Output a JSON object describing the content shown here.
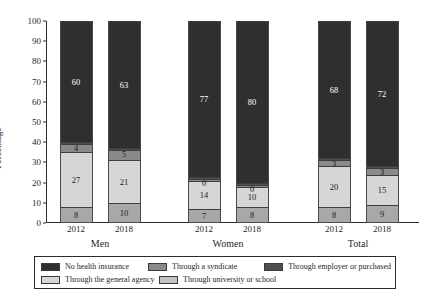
{
  "chart_data": {
    "type": "bar",
    "subtype": "stacked-bar-100",
    "title": "",
    "xlabel": "",
    "ylabel": "Percentage",
    "ylim": [
      0,
      100
    ],
    "ytick_labels": [
      "0",
      "10",
      "20",
      "30",
      "40",
      "50",
      "60",
      "70",
      "80",
      "90",
      "100"
    ],
    "ytick_values": [
      0,
      10,
      20,
      30,
      40,
      50,
      60,
      70,
      80,
      90,
      100
    ],
    "grid": false,
    "legend_position": "bottom",
    "groups": [
      "Men",
      "Women",
      "Total"
    ],
    "categories": [
      "2012",
      "2018",
      "2012",
      "2018",
      "2012",
      "2018"
    ],
    "series": [
      {
        "name": "Through university or school",
        "color": "#a8a8a8",
        "values": [
          8,
          10,
          7,
          8,
          8,
          9
        ],
        "labels": [
          "8",
          "10",
          "7",
          "8",
          "8",
          "9"
        ]
      },
      {
        "name": "Through the general agency",
        "color": "#d6d6d6",
        "values": [
          27,
          21,
          14,
          10,
          20,
          15
        ],
        "labels": [
          "27",
          "21",
          "14",
          "10",
          "20",
          "15"
        ]
      },
      {
        "name": "Through a syndicate",
        "color": "#8a8a8a",
        "values": [
          4,
          5,
          1,
          1,
          3,
          3
        ],
        "labels": [
          "4",
          "5",
          "0",
          "0",
          "3",
          "3"
        ]
      },
      {
        "name": "Through employer or purchased",
        "color": "#4f4f4f",
        "values": [
          1,
          1,
          1,
          1,
          1,
          1
        ],
        "labels": [
          "1",
          "1",
          "0",
          "0",
          "1",
          "1"
        ]
      },
      {
        "name": "No health insurance",
        "color": "#2f2f2f",
        "values": [
          60,
          63,
          77,
          80,
          68,
          72
        ],
        "labels": [
          "60",
          "63",
          "77",
          "80",
          "68",
          "72"
        ]
      }
    ]
  },
  "axis": {
    "y_title": "Percentage"
  },
  "group_labels": [
    {
      "label": "Men"
    },
    {
      "label": "Women"
    },
    {
      "label": "Total"
    }
  ],
  "x_ticks": [
    {
      "label": "2012"
    },
    {
      "label": "2018"
    },
    {
      "label": "2012"
    },
    {
      "label": "2018"
    },
    {
      "label": "2012"
    },
    {
      "label": "2018"
    }
  ],
  "legend": {
    "entries": [
      {
        "label": "No health insurance",
        "color": "#2f2f2f"
      },
      {
        "label": "Through a syndicate",
        "color": "#8a8a8a"
      },
      {
        "label": "Through employer or purchased",
        "color": "#4f4f4f"
      },
      {
        "label": "Through the general agency",
        "color": "#d6d6d6"
      },
      {
        "label": "Through university or school",
        "color": "#c3c3c3"
      }
    ]
  }
}
